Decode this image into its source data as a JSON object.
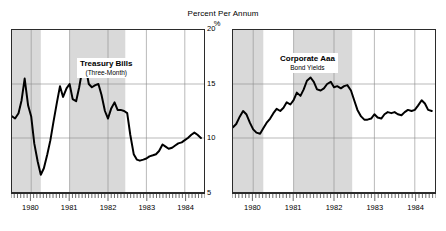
{
  "figure": {
    "title": "Percent Per Annum",
    "unit": "%"
  },
  "axis": {
    "y_ticks": [
      "20",
      "15",
      "10",
      "5"
    ],
    "x_ticks": [
      "1980",
      "1981",
      "1982",
      "1983",
      "1984"
    ]
  },
  "panels": {
    "left": {
      "label_main": "Treasury Bills",
      "label_sub": "(Three-Month)"
    },
    "right": {
      "label_main": "Corporate Aaa",
      "label_sub": "Bond Yields"
    }
  },
  "colors": {
    "line": "#000000",
    "frame": "#2b2b2b",
    "gridline": "#8a8a8a",
    "recession_band": "#d9d9d9",
    "background": "#ffffff"
  },
  "chart_data": {
    "type": "line",
    "title": "Percent Per Annum",
    "xlabel": "",
    "ylabel": "%",
    "ylim": [
      5,
      20
    ],
    "xlim": [
      1979.5,
      1984.5
    ],
    "grid": true,
    "legend": "inline-annotation",
    "y_ticks": [
      5,
      10,
      15,
      20
    ],
    "x_ticks": [
      1980,
      1981,
      1982,
      1983,
      1984
    ],
    "recession_bands": [
      {
        "start": 1979.5,
        "end": 1980.25
      },
      {
        "start": 1981.0,
        "end": 1982.45
      }
    ],
    "panels": [
      {
        "name": "Treasury Bills (Three-Month)",
        "x": [
          1979.5,
          1979.58,
          1979.67,
          1979.75,
          1979.83,
          1979.92,
          1980.0,
          1980.08,
          1980.17,
          1980.25,
          1980.33,
          1980.42,
          1980.5,
          1980.58,
          1980.67,
          1980.75,
          1980.83,
          1980.92,
          1981.0,
          1981.08,
          1981.17,
          1981.25,
          1981.33,
          1981.42,
          1981.5,
          1981.58,
          1981.67,
          1981.75,
          1981.83,
          1981.92,
          1982.0,
          1982.08,
          1982.17,
          1982.25,
          1982.33,
          1982.42,
          1982.5,
          1982.58,
          1982.67,
          1982.75,
          1982.83,
          1982.92,
          1983.0,
          1983.08,
          1983.17,
          1983.25,
          1983.33,
          1983.42,
          1983.5,
          1983.58,
          1983.67,
          1983.75,
          1983.83,
          1983.92,
          1984.0,
          1984.08,
          1984.17,
          1984.25,
          1984.33,
          1984.42
        ],
        "y": [
          12.0,
          11.8,
          12.3,
          13.5,
          15.5,
          13.0,
          12.0,
          9.5,
          7.8,
          6.6,
          7.2,
          8.5,
          9.8,
          11.5,
          13.3,
          14.8,
          13.8,
          14.6,
          15.0,
          13.6,
          13.4,
          14.7,
          16.3,
          16.5,
          15.0,
          14.7,
          14.9,
          15.0,
          14.0,
          12.5,
          11.8,
          12.7,
          13.3,
          12.6,
          12.6,
          12.5,
          12.3,
          10.3,
          8.5,
          8.0,
          7.9,
          8.0,
          8.1,
          8.3,
          8.4,
          8.5,
          8.8,
          9.4,
          9.2,
          9.0,
          9.1,
          9.3,
          9.5,
          9.6,
          9.8,
          10.0,
          10.3,
          10.5,
          10.3,
          10.0
        ],
        "units": "percent per annum"
      },
      {
        "name": "Corporate Aaa Bond Yields",
        "x": [
          1979.5,
          1979.58,
          1979.67,
          1979.75,
          1979.83,
          1979.92,
          1980.0,
          1980.08,
          1980.17,
          1980.25,
          1980.33,
          1980.42,
          1980.5,
          1980.58,
          1980.67,
          1980.75,
          1980.83,
          1980.92,
          1981.0,
          1981.08,
          1981.17,
          1981.25,
          1981.33,
          1981.42,
          1981.5,
          1981.58,
          1981.67,
          1981.75,
          1981.83,
          1981.92,
          1982.0,
          1982.08,
          1982.17,
          1982.25,
          1982.33,
          1982.42,
          1982.5,
          1982.58,
          1982.67,
          1982.75,
          1982.83,
          1982.92,
          1983.0,
          1983.08,
          1983.17,
          1983.25,
          1983.33,
          1983.42,
          1983.5,
          1983.58,
          1983.67,
          1983.75,
          1983.83,
          1983.92,
          1984.0,
          1984.08,
          1984.17,
          1984.25,
          1984.33,
          1984.42
        ],
        "y": [
          11.0,
          11.3,
          12.0,
          12.5,
          12.2,
          11.4,
          10.8,
          10.5,
          10.4,
          10.9,
          11.4,
          11.8,
          12.3,
          12.7,
          12.5,
          12.8,
          13.3,
          13.1,
          13.5,
          14.2,
          13.9,
          14.5,
          15.3,
          15.6,
          15.2,
          14.5,
          14.4,
          14.6,
          15.0,
          15.2,
          14.7,
          14.8,
          14.6,
          14.8,
          14.9,
          14.4,
          13.5,
          12.6,
          12.0,
          11.7,
          11.7,
          11.8,
          12.2,
          11.9,
          11.8,
          12.2,
          12.4,
          12.3,
          12.4,
          12.2,
          12.1,
          12.4,
          12.6,
          12.5,
          12.6,
          13.0,
          13.5,
          13.2,
          12.6,
          12.5
        ],
        "units": "percent per annum"
      }
    ]
  }
}
